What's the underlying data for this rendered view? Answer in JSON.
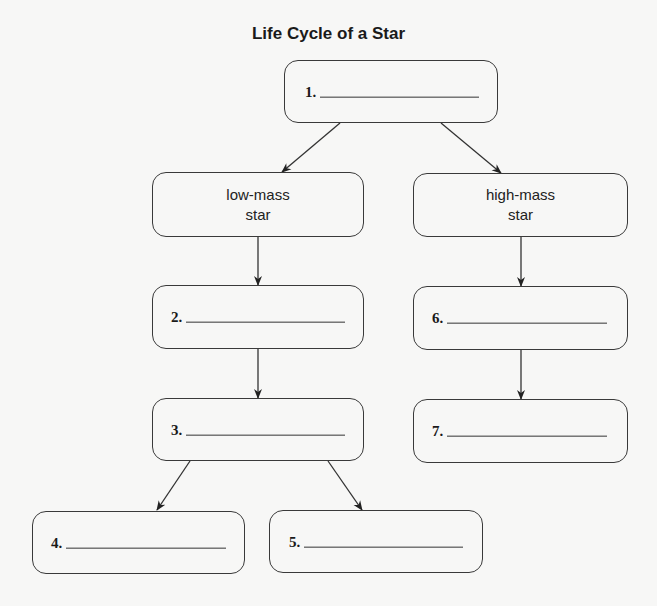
{
  "title": "Life Cycle of a Star",
  "colors": {
    "line": "#333333",
    "background": "#f7f7f6",
    "text": "#1a1a1a"
  },
  "nodes": {
    "n1": {
      "number": "1.",
      "answer": ""
    },
    "low_mass": {
      "line1": "low-mass",
      "line2": "star"
    },
    "high_mass": {
      "line1": "high-mass",
      "line2": "star"
    },
    "n2": {
      "number": "2.",
      "answer": ""
    },
    "n3": {
      "number": "3.",
      "answer": ""
    },
    "n4": {
      "number": "4.",
      "answer": ""
    },
    "n5": {
      "number": "5.",
      "answer": ""
    },
    "n6": {
      "number": "6.",
      "answer": ""
    },
    "n7": {
      "number": "7.",
      "answer": ""
    }
  },
  "edges": [
    {
      "from": "n1",
      "to": "low_mass"
    },
    {
      "from": "n1",
      "to": "high_mass"
    },
    {
      "from": "low_mass",
      "to": "n2"
    },
    {
      "from": "n2",
      "to": "n3"
    },
    {
      "from": "n3",
      "to": "n4"
    },
    {
      "from": "n3",
      "to": "n5"
    },
    {
      "from": "high_mass",
      "to": "n6"
    },
    {
      "from": "n6",
      "to": "n7"
    }
  ]
}
